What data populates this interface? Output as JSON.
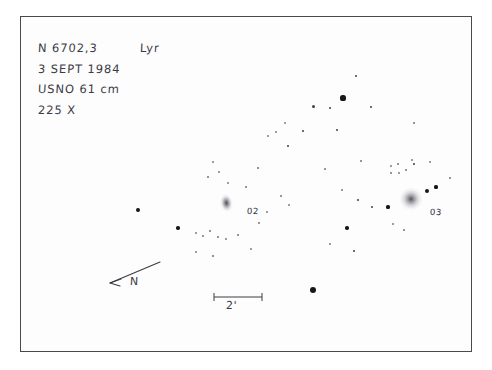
{
  "sketch": {
    "frame": {
      "x": 20,
      "y": 16,
      "width": 452,
      "height": 336
    },
    "annotations": {
      "object_designation": "N 6702,3",
      "constellation": "Lyr",
      "date": "3 SEPT 1984",
      "instrument": "USNO 61 cm",
      "magnification": "225 X"
    },
    "galaxies": [
      {
        "label": "02",
        "name": "ngc6702",
        "x": 226,
        "y": 203,
        "rx": 8.5,
        "ry": 13.5,
        "shape": "elongated-oval",
        "brightness": "moderate"
      },
      {
        "label": "03",
        "name": "ngc6703",
        "x": 411,
        "y": 199,
        "rx": 15,
        "ry": 14,
        "shape": "round-diffuse",
        "brightness": "bright"
      }
    ],
    "compass": {
      "direction_label": "N",
      "tail": {
        "x": 160,
        "y": 262
      },
      "head": {
        "x": 108,
        "y": 283
      },
      "label_x": 130,
      "label_y": 275
    },
    "scale_bar": {
      "label": "2'",
      "x1": 214,
      "x2": 262,
      "y": 296
    },
    "stars": [
      {
        "x": 356,
        "y": 76,
        "r": 1.1
      },
      {
        "x": 343,
        "y": 98,
        "r": 2.6
      },
      {
        "x": 313,
        "y": 106,
        "r": 1.5
      },
      {
        "x": 330,
        "y": 108,
        "r": 1.4
      },
      {
        "x": 371,
        "y": 107,
        "r": 1.3
      },
      {
        "x": 303,
        "y": 131,
        "r": 1.4
      },
      {
        "x": 285,
        "y": 123,
        "r": 1.0
      },
      {
        "x": 276,
        "y": 132,
        "r": 0.9
      },
      {
        "x": 268,
        "y": 136,
        "r": 1.0
      },
      {
        "x": 288,
        "y": 146,
        "r": 1.2
      },
      {
        "x": 337,
        "y": 130,
        "r": 1.2
      },
      {
        "x": 414,
        "y": 123,
        "r": 0.8
      },
      {
        "x": 213,
        "y": 162,
        "r": 0.9
      },
      {
        "x": 219,
        "y": 172,
        "r": 0.9
      },
      {
        "x": 208,
        "y": 177,
        "r": 0.8
      },
      {
        "x": 228,
        "y": 183,
        "r": 0.9
      },
      {
        "x": 246,
        "y": 187,
        "r": 0.8
      },
      {
        "x": 138,
        "y": 210,
        "r": 1.9
      },
      {
        "x": 178,
        "y": 228,
        "r": 1.7
      },
      {
        "x": 196,
        "y": 233,
        "r": 0.9
      },
      {
        "x": 203,
        "y": 236,
        "r": 0.8
      },
      {
        "x": 210,
        "y": 231,
        "r": 0.8
      },
      {
        "x": 218,
        "y": 237,
        "r": 0.8
      },
      {
        "x": 226,
        "y": 239,
        "r": 0.9
      },
      {
        "x": 238,
        "y": 235,
        "r": 0.8
      },
      {
        "x": 196,
        "y": 252,
        "r": 0.9
      },
      {
        "x": 213,
        "y": 256,
        "r": 0.8
      },
      {
        "x": 251,
        "y": 249,
        "r": 0.9
      },
      {
        "x": 259,
        "y": 223,
        "r": 0.8
      },
      {
        "x": 267,
        "y": 212,
        "r": 0.9
      },
      {
        "x": 313,
        "y": 290,
        "r": 3.3
      },
      {
        "x": 347,
        "y": 228,
        "r": 1.7
      },
      {
        "x": 354,
        "y": 251,
        "r": 1.3
      },
      {
        "x": 330,
        "y": 244,
        "r": 0.9
      },
      {
        "x": 372,
        "y": 207,
        "r": 1.2
      },
      {
        "x": 388,
        "y": 207,
        "r": 1.6
      },
      {
        "x": 391,
        "y": 166,
        "r": 0.9
      },
      {
        "x": 398,
        "y": 164,
        "r": 0.8
      },
      {
        "x": 391,
        "y": 173,
        "r": 0.8
      },
      {
        "x": 399,
        "y": 173,
        "r": 0.9
      },
      {
        "x": 406,
        "y": 170,
        "r": 0.8
      },
      {
        "x": 412,
        "y": 160,
        "r": 0.9
      },
      {
        "x": 414,
        "y": 164,
        "r": 1.2
      },
      {
        "x": 430,
        "y": 162,
        "r": 1.0
      },
      {
        "x": 427,
        "y": 191,
        "r": 2.4
      },
      {
        "x": 436,
        "y": 187,
        "r": 1.6
      },
      {
        "x": 393,
        "y": 224,
        "r": 0.9
      },
      {
        "x": 404,
        "y": 230,
        "r": 0.8
      },
      {
        "x": 358,
        "y": 200,
        "r": 1.2
      },
      {
        "x": 342,
        "y": 190,
        "r": 0.9
      },
      {
        "x": 289,
        "y": 205,
        "r": 0.9
      },
      {
        "x": 281,
        "y": 196,
        "r": 0.8
      },
      {
        "x": 258,
        "y": 168,
        "r": 0.8
      },
      {
        "x": 325,
        "y": 169,
        "r": 0.8
      },
      {
        "x": 361,
        "y": 161,
        "r": 0.8
      },
      {
        "x": 450,
        "y": 178,
        "r": 0.8
      }
    ],
    "colors": {
      "ink": "#3b3b46",
      "star": "#17171c",
      "frame": "#4a4a4a",
      "paper": "#fdfdfd"
    }
  }
}
